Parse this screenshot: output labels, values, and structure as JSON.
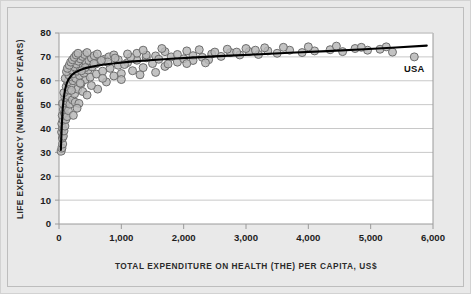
{
  "chart_data": {
    "type": "scatter",
    "title": "",
    "xlabel": "TOTAL EXPENDITURE ON HEALTH (THE) PER CAPITA, US$",
    "ylabel": "LIFE EXPECTANCY (NUMBER OF YEARS)",
    "xlim": [
      0,
      6000
    ],
    "ylim": [
      0,
      80
    ],
    "xticks": [
      0,
      1000,
      2000,
      3000,
      4000,
      5000,
      6000
    ],
    "xticklabels": [
      "0",
      "1,000",
      "2,000",
      "3,000",
      "4,000",
      "5,000",
      "6,000"
    ],
    "yticks": [
      0,
      10,
      20,
      30,
      40,
      50,
      60,
      70,
      80
    ],
    "yticklabels": [
      "0",
      "10",
      "20",
      "30",
      "40",
      "50",
      "60",
      "70",
      "80"
    ],
    "grid": "horizontal",
    "legend": "none",
    "marker": {
      "shape": "circle",
      "fill": "#b9b9b9",
      "edge": "#6e6e6e",
      "size_px": 8,
      "opacity": 0.85
    },
    "trendline": {
      "label": "logarithmic fit",
      "color": "#000000",
      "width_px": 2.1,
      "points": [
        [
          30,
          31.0
        ],
        [
          40,
          38.0
        ],
        [
          50,
          44.0
        ],
        [
          60,
          48.5
        ],
        [
          75,
          52.5
        ],
        [
          95,
          56.0
        ],
        [
          120,
          58.6
        ],
        [
          150,
          60.5
        ],
        [
          200,
          62.3
        ],
        [
          260,
          63.5
        ],
        [
          340,
          64.5
        ],
        [
          440,
          65.4
        ],
        [
          560,
          66.1
        ],
        [
          700,
          66.7
        ],
        [
          900,
          67.3
        ],
        [
          1150,
          68.0
        ],
        [
          1450,
          68.6
        ],
        [
          1800,
          69.2
        ],
        [
          2200,
          69.8
        ],
        [
          2650,
          70.4
        ],
        [
          3150,
          71.0
        ],
        [
          3700,
          71.7
        ],
        [
          4300,
          72.4
        ],
        [
          4900,
          73.2
        ],
        [
          5400,
          73.9
        ],
        [
          5900,
          74.7
        ]
      ]
    },
    "annotations": [
      {
        "text": "USA",
        "x": 5700,
        "y": 63.5,
        "align": "middle"
      }
    ],
    "points": [
      [
        35,
        30.5
      ],
      [
        48,
        31.8
      ],
      [
        60,
        33.5
      ],
      [
        55,
        36.0
      ],
      [
        42,
        38.5
      ],
      [
        70,
        36.8
      ],
      [
        58,
        40.2
      ],
      [
        80,
        39.0
      ],
      [
        45,
        42.0
      ],
      [
        95,
        41.0
      ],
      [
        66,
        43.5
      ],
      [
        110,
        43.8
      ],
      [
        52,
        45.5
      ],
      [
        88,
        46.5
      ],
      [
        130,
        45.0
      ],
      [
        72,
        48.0
      ],
      [
        105,
        49.0
      ],
      [
        150,
        47.5
      ],
      [
        60,
        50.5
      ],
      [
        125,
        51.5
      ],
      [
        175,
        50.2
      ],
      [
        92,
        53.0
      ],
      [
        145,
        53.8
      ],
      [
        215,
        52.0
      ],
      [
        78,
        55.0
      ],
      [
        165,
        56.0
      ],
      [
        250,
        54.5
      ],
      [
        115,
        57.5
      ],
      [
        195,
        58.2
      ],
      [
        300,
        56.5
      ],
      [
        140,
        59.5
      ],
      [
        225,
        60.0
      ],
      [
        355,
        58.8
      ],
      [
        100,
        61.0
      ],
      [
        180,
        61.8
      ],
      [
        270,
        61.0
      ],
      [
        420,
        60.5
      ],
      [
        155,
        62.5
      ],
      [
        235,
        63.0
      ],
      [
        330,
        62.2
      ],
      [
        500,
        61.5
      ],
      [
        120,
        63.8
      ],
      [
        205,
        64.5
      ],
      [
        290,
        64.0
      ],
      [
        400,
        63.2
      ],
      [
        600,
        62.8
      ],
      [
        135,
        65.2
      ],
      [
        250,
        65.8
      ],
      [
        345,
        65.0
      ],
      [
        465,
        64.5
      ],
      [
        700,
        64.0
      ],
      [
        165,
        66.5
      ],
      [
        280,
        67.0
      ],
      [
        390,
        66.2
      ],
      [
        530,
        65.8
      ],
      [
        820,
        65.2
      ],
      [
        190,
        67.8
      ],
      [
        310,
        68.2
      ],
      [
        435,
        67.5
      ],
      [
        590,
        67.0
      ],
      [
        950,
        66.5
      ],
      [
        215,
        68.8
      ],
      [
        340,
        69.2
      ],
      [
        480,
        68.5
      ],
      [
        660,
        68.0
      ],
      [
        1100,
        67.6
      ],
      [
        245,
        69.8
      ],
      [
        375,
        70.2
      ],
      [
        520,
        69.5
      ],
      [
        730,
        69.0
      ],
      [
        1250,
        68.6
      ],
      [
        275,
        70.8
      ],
      [
        410,
        71.0
      ],
      [
        565,
        70.5
      ],
      [
        800,
        70.0
      ],
      [
        1400,
        69.6
      ],
      [
        305,
        71.5
      ],
      [
        450,
        71.8
      ],
      [
        615,
        71.2
      ],
      [
        880,
        70.8
      ],
      [
        1550,
        70.4
      ],
      [
        200,
        56.0
      ],
      [
        260,
        51.0
      ],
      [
        320,
        50.5
      ],
      [
        230,
        45.5
      ],
      [
        290,
        48.5
      ],
      [
        380,
        55.5
      ],
      [
        450,
        54.0
      ],
      [
        620,
        56.5
      ],
      [
        340,
        59.0
      ],
      [
        520,
        58.0
      ],
      [
        760,
        59.5
      ],
      [
        1000,
        63.0
      ],
      [
        1180,
        64.2
      ],
      [
        880,
        62.0
      ],
      [
        1350,
        65.5
      ],
      [
        1050,
        66.8
      ],
      [
        1500,
        67.2
      ],
      [
        1700,
        66.0
      ],
      [
        1900,
        67.8
      ],
      [
        1600,
        69.0
      ],
      [
        1800,
        70.0
      ],
      [
        2000,
        69.2
      ],
      [
        2150,
        70.5
      ],
      [
        2300,
        69.8
      ],
      [
        2450,
        71.2
      ],
      [
        2600,
        70.2
      ],
      [
        2750,
        71.8
      ],
      [
        2900,
        70.8
      ],
      [
        3050,
        72.2
      ],
      [
        3200,
        71.0
      ],
      [
        3350,
        72.5
      ],
      [
        2050,
        72.5
      ],
      [
        2250,
        73.0
      ],
      [
        2500,
        72.0
      ],
      [
        2700,
        73.2
      ],
      [
        2850,
        72.0
      ],
      [
        3000,
        73.5
      ],
      [
        3150,
        72.8
      ],
      [
        3300,
        73.8
      ],
      [
        1700,
        72.2
      ],
      [
        1900,
        71.0
      ],
      [
        2150,
        68.5
      ],
      [
        2400,
        68.8
      ],
      [
        1550,
        63.5
      ],
      [
        1750,
        67.0
      ],
      [
        2050,
        67.2
      ],
      [
        2350,
        67.5
      ],
      [
        3500,
        71.5
      ],
      [
        3700,
        72.8
      ],
      [
        3900,
        71.8
      ],
      [
        4100,
        72.5
      ],
      [
        4350,
        73.0
      ],
      [
        4550,
        72.2
      ],
      [
        4750,
        73.5
      ],
      [
        4950,
        72.8
      ],
      [
        5150,
        73.2
      ],
      [
        5350,
        72.0
      ],
      [
        3600,
        74.0
      ],
      [
        4000,
        74.2
      ],
      [
        4450,
        74.5
      ],
      [
        4850,
        74.0
      ],
      [
        5250,
        74.2
      ],
      [
        5700,
        70.0
      ],
      [
        1250,
        71.5
      ],
      [
        1400,
        70.8
      ],
      [
        1150,
        69.8
      ],
      [
        950,
        68.8
      ],
      [
        780,
        67.8
      ],
      [
        1650,
        73.5
      ],
      [
        1350,
        72.8
      ],
      [
        1100,
        71.2
      ],
      [
        900,
        69.5
      ],
      [
        680,
        68.5
      ],
      [
        560,
        67.2
      ],
      [
        420,
        65.5
      ],
      [
        360,
        64.2
      ],
      [
        1000,
        60.5
      ],
      [
        1300,
        62.5
      ],
      [
        700,
        61.0
      ]
    ]
  },
  "axis_titles": {
    "x": "TOTAL EXPENDITURE ON HEALTH (THE) PER CAPITA, US$",
    "y": "LIFE EXPECTANCY (NUMBER OF YEARS)"
  },
  "colors": {
    "background": "#e9e9e9",
    "plot_background": "#ffffff",
    "gridline": "#c8c8c8",
    "axis": "#9a9a9a",
    "marker_fill": "#b9b9b9",
    "marker_edge": "#6e6e6e",
    "trendline": "#000000",
    "text": "#1d1d1d"
  }
}
